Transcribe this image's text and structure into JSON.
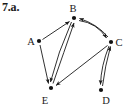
{
  "figure": {
    "problem_label": "7.a.",
    "width": 131,
    "height": 108,
    "background_color": "#ffffff",
    "ink_color": "#1a1a1a"
  },
  "graph": {
    "type": "directed-graph",
    "node_count": 5,
    "edge_count": 9,
    "nodes": [
      {
        "id": "A",
        "label": "A",
        "x": 39,
        "y": 41,
        "label_x": 31,
        "label_y": 44
      },
      {
        "id": "B",
        "label": "B",
        "x": 74,
        "y": 18,
        "label_x": 71,
        "label_y": 12
      },
      {
        "id": "C",
        "label": "C",
        "x": 111,
        "y": 42,
        "label_x": 116,
        "label_y": 45
      },
      {
        "id": "D",
        "label": "D",
        "x": 101,
        "y": 90,
        "label_x": 105,
        "label_y": 103
      },
      {
        "id": "E",
        "label": "E",
        "x": 51,
        "y": 88,
        "label_x": 43,
        "label_y": 103
      }
    ],
    "edges": [
      {
        "from": "A",
        "to": "B",
        "shape": "straight",
        "arrow_at": "B"
      },
      {
        "from": "A",
        "to": "E",
        "shape": "straight",
        "arrow_at": "E"
      },
      {
        "from": "B",
        "to": "C",
        "shape": "curved",
        "arrow_at": "C"
      },
      {
        "from": "C",
        "to": "B",
        "shape": "curved",
        "arrow_at": "B"
      },
      {
        "from": "B",
        "to": "E",
        "shape": "straight",
        "arrow_at": "E"
      },
      {
        "from": "E",
        "to": "B",
        "shape": "straight",
        "arrow_at": "B"
      },
      {
        "from": "C",
        "to": "E",
        "shape": "straight",
        "arrow_at": "E"
      },
      {
        "from": "C",
        "to": "D",
        "shape": "curved",
        "arrow_at": "D"
      },
      {
        "from": "D",
        "to": "C",
        "shape": "curved",
        "arrow_at": "C"
      }
    ]
  }
}
